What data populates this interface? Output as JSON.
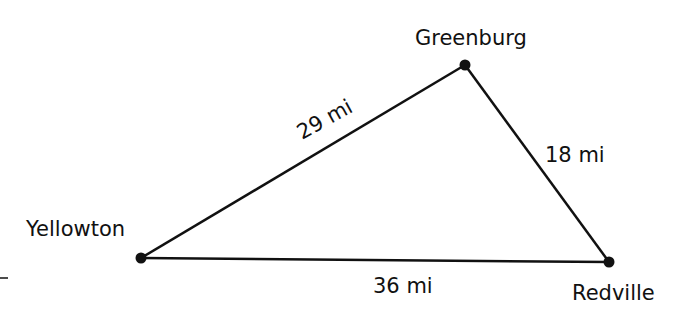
{
  "diagram": {
    "type": "triangle-map",
    "colors": {
      "ink": "#111111",
      "background": "#ffffff"
    },
    "towns": [
      {
        "name": "Greenburg",
        "x": 465,
        "y": 65
      },
      {
        "name": "Yellowton",
        "x": 141,
        "y": 258
      },
      {
        "name": "Redville",
        "x": 609,
        "y": 262
      }
    ],
    "distances": [
      {
        "from": "Yellowton",
        "to": "Greenburg",
        "label": "29 mi"
      },
      {
        "from": "Greenburg",
        "to": "Redville",
        "label": "18 mi"
      },
      {
        "from": "Yellowton",
        "to": "Redville",
        "label": "36 mi"
      }
    ]
  }
}
